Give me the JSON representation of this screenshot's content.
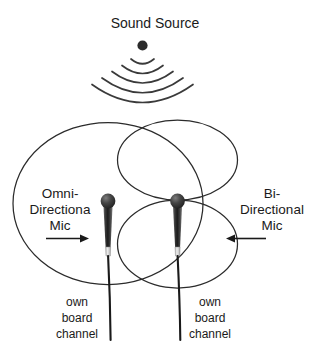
{
  "diagram": {
    "title": "Sound Source",
    "source": {
      "icon": "sound-source-dot",
      "wave_arc_count": 5
    },
    "microphones": [
      {
        "id": "omni",
        "label_line1": "Omni-",
        "label_line2": "Directiona",
        "label_line3": "Mic",
        "arrow_direction": "right",
        "pattern": "circle",
        "cable_label_line1": "own",
        "cable_label_line2": "board",
        "cable_label_line3": "channel"
      },
      {
        "id": "bi",
        "label_line1": "Bi-",
        "label_line2": "Directional",
        "label_line3": "Mic",
        "arrow_direction": "left",
        "pattern": "figure-eight",
        "cable_label_line1": "own",
        "cable_label_line2": "board",
        "cable_label_line3": "channel"
      }
    ],
    "colors": {
      "background": "#ffffff",
      "ink": "#1a1a1a",
      "curve": "#2b2b2b",
      "mic_body_dark": "#2e2e2e",
      "mic_body_light": "#8a8a8a",
      "mic_band": "#d8d8d8"
    }
  }
}
